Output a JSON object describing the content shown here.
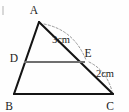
{
  "figure": {
    "background_color": "#fefefe",
    "stroke_color": "#141414",
    "midline_color": "#6f6f6f",
    "arc_color": "#8d8d8d",
    "vertices": {
      "A": {
        "label": "A",
        "x": 39,
        "y": 22,
        "label_x": 34,
        "label_y": 14
      },
      "B": {
        "label": "B",
        "x": 14,
        "y": 94,
        "label_x": 9,
        "label_y": 108
      },
      "C": {
        "label": "C",
        "x": 113,
        "y": 94,
        "label_x": 107,
        "label_y": 108
      },
      "D": {
        "label": "D",
        "x": 24,
        "y": 62,
        "label_x": 11,
        "label_y": 60
      },
      "E": {
        "label": "E",
        "x": 84,
        "y": 62,
        "label_x": 84,
        "label_y": 57
      }
    },
    "segments": [
      {
        "name": "side-AB",
        "from": "A",
        "to": "B",
        "style": "dark"
      },
      {
        "name": "side-AC",
        "from": "A",
        "to": "C",
        "style": "dark"
      },
      {
        "name": "side-BC",
        "from": "B",
        "to": "C",
        "style": "dark"
      },
      {
        "name": "segment-DE",
        "from": "D",
        "to": "E",
        "style": "mid"
      }
    ],
    "measures": [
      {
        "name": "measure-AE",
        "text": "3cm",
        "label_x": 60,
        "label_y": 41,
        "arc_path": "M 44 24 Q 74 30 86 60"
      },
      {
        "name": "measure-EC",
        "text": "2cm",
        "label_x": 95,
        "label_y": 75,
        "arc_path": "M 89 62 Q 106 70 112 91"
      }
    ]
  }
}
